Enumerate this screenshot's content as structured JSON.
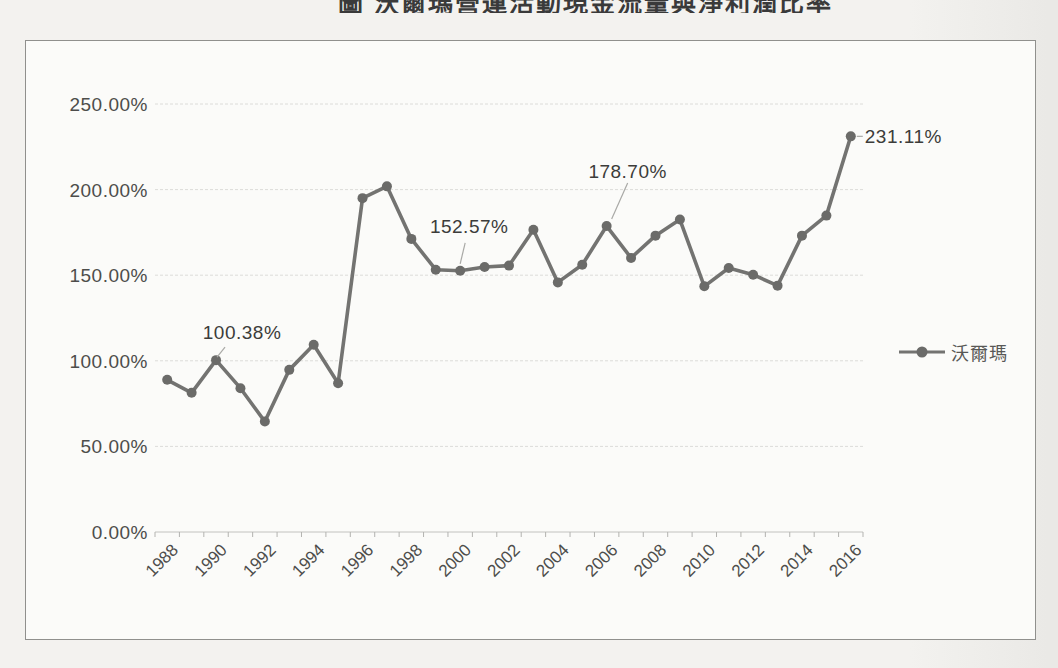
{
  "figure_title": "圖 沃爾瑪營運活動現金流量與淨利潤比率",
  "legend": {
    "label": "沃爾瑪"
  },
  "colors": {
    "series_line": "#737371",
    "marker": "#6b6b69",
    "grid_line": "#dcdcd9",
    "axis_line": "#c2c2bf",
    "tick": "#b3b3b0",
    "axis_text": "#4d4d4b",
    "data_label_text": "#3c3c3a",
    "leader_line": "#a9a9a6"
  },
  "chart_data": {
    "type": "line",
    "title": "圖 沃爾瑪營運活動現金流量與淨利潤比率",
    "legend_position": "right",
    "grid": true,
    "ylim": [
      0,
      250
    ],
    "yticks": [
      {
        "value": 0,
        "label": "0.00%"
      },
      {
        "value": 50,
        "label": "50.00%"
      },
      {
        "value": 100,
        "label": "100.00%"
      },
      {
        "value": 150,
        "label": "150.00%"
      },
      {
        "value": 200,
        "label": "200.00%"
      },
      {
        "value": 250,
        "label": "250.00%"
      }
    ],
    "xticks": [
      {
        "year": 1988,
        "label": "1988"
      },
      {
        "year": 1990,
        "label": "1990"
      },
      {
        "year": 1992,
        "label": "1992"
      },
      {
        "year": 1994,
        "label": "1994"
      },
      {
        "year": 1996,
        "label": "1996"
      },
      {
        "year": 1998,
        "label": "1998"
      },
      {
        "year": 2000,
        "label": "2000"
      },
      {
        "year": 2002,
        "label": "2002"
      },
      {
        "year": 2004,
        "label": "2004"
      },
      {
        "year": 2006,
        "label": "2006"
      },
      {
        "year": 2008,
        "label": "2008"
      },
      {
        "year": 2010,
        "label": "2010"
      },
      {
        "year": 2012,
        "label": "2012"
      },
      {
        "year": 2014,
        "label": "2014"
      },
      {
        "year": 2016,
        "label": "2016"
      }
    ],
    "series": [
      {
        "name": "沃爾瑪",
        "x": [
          1988,
          1989,
          1990,
          1991,
          1992,
          1993,
          1994,
          1995,
          1996,
          1997,
          1998,
          1999,
          2000,
          2001,
          2002,
          2003,
          2004,
          2005,
          2006,
          2007,
          2008,
          2009,
          2010,
          2011,
          2012,
          2013,
          2014,
          2015,
          2016
        ],
        "values": [
          88.9,
          81.3,
          100.38,
          84.0,
          64.5,
          94.7,
          109.4,
          86.9,
          195.0,
          201.9,
          171.2,
          153.2,
          152.57,
          154.8,
          155.6,
          176.6,
          145.8,
          156.1,
          178.7,
          160.1,
          173.1,
          182.5,
          143.5,
          154.2,
          150.3,
          143.9,
          173.1,
          184.8,
          231.11
        ]
      }
    ],
    "annotations": [
      {
        "year": 1990,
        "text": "100.38%"
      },
      {
        "year": 2000,
        "text": "152.57%"
      },
      {
        "year": 2006,
        "text": "178.70%"
      },
      {
        "year": 2016,
        "text": "231.11%"
      }
    ]
  }
}
